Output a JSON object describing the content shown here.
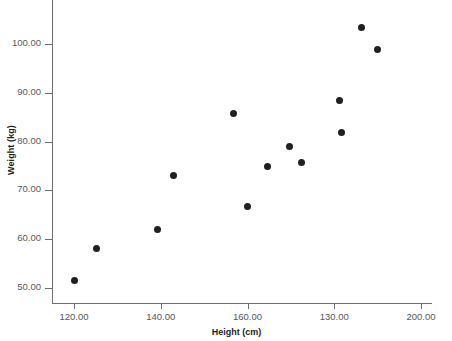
{
  "chart_data": {
    "type": "scatter",
    "title": "",
    "xlabel": "Height (cm)",
    "ylabel": "Weight (kg)",
    "xlim": [
      114.5,
      202.5
    ],
    "ylim": [
      47.0,
      105.5
    ],
    "grid": false,
    "legend": null,
    "marker": {
      "shape": "circle",
      "color": "#231f20",
      "size": 7
    },
    "xticks": [
      120,
      140,
      160,
      180,
      200
    ],
    "xtick_labels": [
      "120.00",
      "140.00",
      "160.00",
      "130.00",
      "200.00"
    ],
    "yticks": [
      50,
      60,
      70,
      80,
      90,
      100
    ],
    "ytick_labels": [
      "50.00",
      "60.00",
      "70.00",
      "80.00",
      "90.00",
      "100.00"
    ],
    "series": [
      {
        "name": "observations",
        "x": [
          120.0,
          125.3,
          139.3,
          143.0,
          156.8,
          160.0,
          164.7,
          169.7,
          172.5,
          181.3,
          181.6,
          186.3,
          190.0,
          190.8
        ],
        "y": [
          51.6,
          58.0,
          62.0,
          73.0,
          85.8,
          66.8,
          74.8,
          78.9,
          75.7,
          88.5,
          81.8,
          103.4,
          98.9,
          81.8
        ],
        "points": [
          {
            "x": 120.0,
            "y": 51.6
          },
          {
            "x": 125.3,
            "y": 58.0
          },
          {
            "x": 139.3,
            "y": 62.0
          },
          {
            "x": 143.0,
            "y": 73.0
          },
          {
            "x": 156.8,
            "y": 85.8
          },
          {
            "x": 160.0,
            "y": 66.8
          },
          {
            "x": 164.7,
            "y": 74.8
          },
          {
            "x": 169.7,
            "y": 78.9
          },
          {
            "x": 172.5,
            "y": 75.7
          },
          {
            "x": 181.3,
            "y": 88.5
          },
          {
            "x": 181.6,
            "y": 81.8
          },
          {
            "x": 186.3,
            "y": 103.4
          },
          {
            "x": 190.0,
            "y": 98.9
          }
        ]
      }
    ],
    "n_points": 13
  },
  "axes": {
    "y_title": "Weight (kg)",
    "x_title": "Height (cm)",
    "y_labels": [
      "100.00",
      "90.00",
      "80.00",
      "70.00",
      "60.00",
      "50.00"
    ],
    "x_labels": [
      "120.00",
      "140.00",
      "160.00",
      "130.00",
      "200.00"
    ],
    "axis_color": "#6d6e71",
    "label_color": "#58595b"
  }
}
